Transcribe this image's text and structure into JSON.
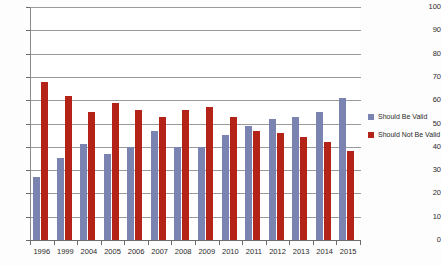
{
  "chart_data": {
    "type": "bar",
    "title": "",
    "xlabel": "",
    "ylabel": "",
    "ylim": [
      0,
      100
    ],
    "ytick_step": 10,
    "grid": true,
    "legend_position": "right",
    "categories": [
      "1996",
      "1999",
      "2004",
      "2005",
      "2006",
      "2007",
      "2008",
      "2009",
      "2010",
      "2011",
      "2012",
      "2013",
      "2014",
      "2015"
    ],
    "ytick_labels": [
      "100",
      "90",
      "80",
      "70",
      "60",
      "50",
      "40",
      "30",
      "20",
      "10",
      "0"
    ],
    "ytick_values": [
      100,
      90,
      80,
      70,
      60,
      50,
      40,
      30,
      20,
      10,
      0
    ],
    "series": [
      {
        "name": "Should Be Valid",
        "color": "#7b84b0",
        "values": [
          27,
          35,
          41,
          37,
          40,
          47,
          40,
          40,
          45,
          49,
          52,
          53,
          55,
          61
        ]
      },
      {
        "name": "Should Not Be Valid",
        "color": "#b32317",
        "values": [
          68,
          62,
          55,
          59,
          56,
          53,
          56,
          57,
          53,
          47,
          46,
          44,
          42,
          38
        ]
      }
    ]
  },
  "legend": {
    "items": [
      {
        "label": "Should Be Valid",
        "color": "#7b84b0"
      },
      {
        "label": "Should Not Be Valid",
        "color": "#b32317"
      }
    ]
  }
}
